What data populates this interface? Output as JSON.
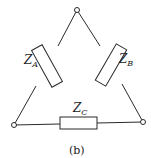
{
  "diagram": {
    "type": "delta-connection-circuit",
    "caption": "(b)",
    "nodes": [
      {
        "id": "top",
        "x": 77,
        "y": 10
      },
      {
        "id": "bottom-left",
        "x": 14,
        "y": 125
      },
      {
        "id": "bottom-right",
        "x": 143,
        "y": 122
      }
    ],
    "impedances": [
      {
        "id": "A",
        "label_main": "Z",
        "label_sub": "A",
        "between": [
          "top",
          "bottom-left"
        ]
      },
      {
        "id": "B",
        "label_main": "Z",
        "label_sub": "B",
        "between": [
          "top",
          "bottom-right"
        ]
      },
      {
        "id": "C",
        "label_main": "Z",
        "label_sub": "C",
        "between": [
          "bottom-left",
          "bottom-right"
        ]
      }
    ],
    "colors": {
      "line": "#2a2a2a",
      "background": "#ffffff"
    }
  }
}
